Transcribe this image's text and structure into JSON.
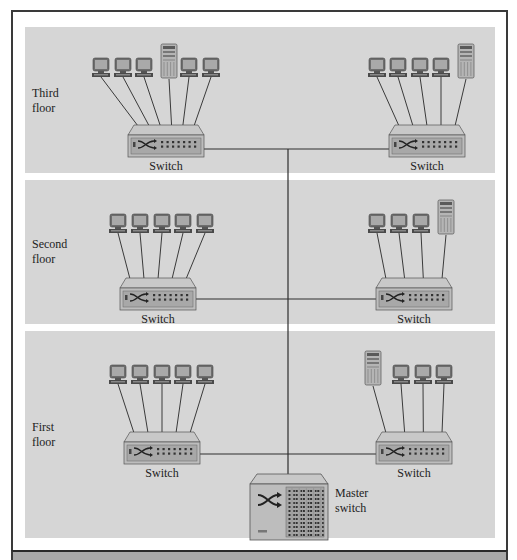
{
  "diagram": {
    "type": "network-topology",
    "title": "",
    "colors": {
      "panel": "#d6d6d6",
      "frame": "#3a3a3a",
      "device_body": "#bdbdbd",
      "device_face": "#a8a8a8",
      "screen": "#8a8a8a",
      "line": "#2e2e2e"
    },
    "floors": [
      {
        "id": "third",
        "label_line1": "Third",
        "label_line2": "floor",
        "panel": {
          "x": 25,
          "y": 27,
          "w": 470,
          "h": 146
        },
        "label_pos": {
          "x": 32,
          "y": 97
        },
        "switches": [
          {
            "label": "Switch",
            "x": 128,
            "y": 125,
            "w": 76,
            "h": 32,
            "devices": [
              "pc",
              "pc",
              "pc",
              "server",
              "pc",
              "pc"
            ],
            "device_x": [
              101,
              123,
              144,
              169,
              189,
              211
            ],
            "device_y": 58
          },
          {
            "label": "Switch",
            "x": 389,
            "y": 125,
            "w": 76,
            "h": 32,
            "devices": [
              "pc",
              "pc",
              "pc",
              "pc",
              "server"
            ],
            "device_x": [
              377,
              398,
              420,
              441,
              466
            ],
            "device_y": 58
          }
        ],
        "link_y": 149
      },
      {
        "id": "second",
        "label_line1": "Second",
        "label_line2": "floor",
        "panel": {
          "x": 25,
          "y": 180,
          "w": 470,
          "h": 144
        },
        "label_pos": {
          "x": 32,
          "y": 248
        },
        "switches": [
          {
            "label": "Switch",
            "x": 120,
            "y": 278,
            "w": 76,
            "h": 32,
            "devices": [
              "pc",
              "pc",
              "pc",
              "pc",
              "pc"
            ],
            "device_x": [
              118,
              140,
              162,
              183,
              205
            ],
            "device_y": 214
          },
          {
            "label": "Switch",
            "x": 376,
            "y": 278,
            "w": 76,
            "h": 32,
            "devices": [
              "pc",
              "pc",
              "pc",
              "server"
            ],
            "device_x": [
              377,
              399,
              421,
              446
            ],
            "device_y": 214
          }
        ],
        "link_y": 299
      },
      {
        "id": "first",
        "label_line1": "First",
        "label_line2": "floor",
        "panel": {
          "x": 25,
          "y": 331,
          "w": 470,
          "h": 207
        },
        "label_pos": {
          "x": 32,
          "y": 431
        },
        "switches": [
          {
            "label": "Switch",
            "x": 124,
            "y": 432,
            "w": 76,
            "h": 32,
            "devices": [
              "pc",
              "pc",
              "pc",
              "pc",
              "pc"
            ],
            "device_x": [
              118,
              140,
              162,
              183,
              205
            ],
            "device_y": 365
          },
          {
            "label": "Switch",
            "x": 376,
            "y": 432,
            "w": 76,
            "h": 32,
            "devices": [
              "server",
              "pc",
              "pc",
              "pc"
            ],
            "device_x": [
              373,
              401,
              423,
              444
            ],
            "device_y": 365
          }
        ],
        "link_y": 454
      }
    ],
    "master_switch": {
      "label_line1": "Master",
      "label_line2": "switch",
      "x": 250,
      "y": 474,
      "w": 78,
      "h": 66,
      "label_pos": {
        "x": 335,
        "y": 497
      }
    },
    "backbone_x": 288,
    "nodes": [
      {
        "id": "sw3L",
        "label": "Switch",
        "floor": "Third floor",
        "connected_devices": [
          "PC",
          "PC",
          "PC",
          "Server",
          "PC",
          "PC"
        ]
      },
      {
        "id": "sw3R",
        "label": "Switch",
        "floor": "Third floor",
        "connected_devices": [
          "PC",
          "PC",
          "PC",
          "PC",
          "Server"
        ]
      },
      {
        "id": "sw2L",
        "label": "Switch",
        "floor": "Second floor",
        "connected_devices": [
          "PC",
          "PC",
          "PC",
          "PC",
          "PC"
        ]
      },
      {
        "id": "sw2R",
        "label": "Switch",
        "floor": "Second floor",
        "connected_devices": [
          "PC",
          "PC",
          "PC",
          "Server"
        ]
      },
      {
        "id": "sw1L",
        "label": "Switch",
        "floor": "First floor",
        "connected_devices": [
          "PC",
          "PC",
          "PC",
          "PC",
          "PC"
        ]
      },
      {
        "id": "sw1R",
        "label": "Switch",
        "floor": "First floor",
        "connected_devices": [
          "Server",
          "PC",
          "PC",
          "PC"
        ]
      },
      {
        "id": "master",
        "label": "Master switch"
      }
    ],
    "edges": [
      [
        "sw3L",
        "master"
      ],
      [
        "sw3R",
        "master"
      ],
      [
        "sw2L",
        "master"
      ],
      [
        "sw2R",
        "master"
      ],
      [
        "sw1L",
        "master"
      ],
      [
        "sw1R",
        "master"
      ]
    ]
  }
}
